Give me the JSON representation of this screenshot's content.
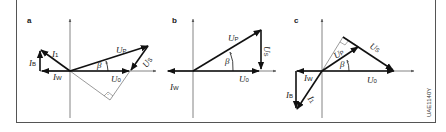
{
  "figure": {
    "code": "UAE1140Y",
    "panels": [
      {
        "id": "a",
        "label": "a",
        "vectors": [
          "U_P",
          "U_S",
          "U_0",
          "I_1",
          "I_B",
          "I_W"
        ],
        "angle": "β",
        "right_angle_marker": true
      },
      {
        "id": "b",
        "label": "b",
        "vectors": [
          "U_P",
          "U_S",
          "U_0",
          "I_W"
        ],
        "angle": "β",
        "right_angle_marker": false
      },
      {
        "id": "c",
        "label": "c",
        "vectors": [
          "U_P",
          "U_S",
          "U_0",
          "I_1",
          "I_B",
          "I_W"
        ],
        "angle": "β",
        "right_angle_marker": true
      }
    ]
  },
  "labels": {
    "a": "a",
    "b": "b",
    "c": "c",
    "U": "U",
    "I": "I",
    "beta": "β",
    "P": "P",
    "S": "S",
    "zero": "0",
    "one": "1",
    "B": "B",
    "W": "W",
    "code": "UAE1140Y"
  }
}
